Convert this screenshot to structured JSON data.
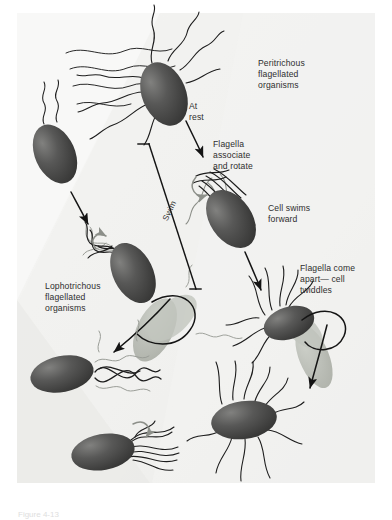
{
  "figure": {
    "domain": "Diagram",
    "caption": "Figure 4-13",
    "width": 392,
    "height": 518
  },
  "colors": {
    "background": "#f4f4f2",
    "background_band_light": "#fbfbfa",
    "background_band_dark": "#ececeb",
    "cell_body_dark": "#3c3c3c",
    "cell_body_highlight": "#6f6f6f",
    "cell_body_ghost": "#b9bcb6",
    "flagella_stroke": "#1d1d1d",
    "flagella_ghost_stroke": "#9a9d97",
    "arrow_black": "#141414",
    "arrow_gray": "#8c8f89",
    "text": "#2e2e2e",
    "caption_text": "#dedede"
  },
  "labels": {
    "peritrichous": "Peritrichous\nflagellated\norganisms",
    "at_rest": "At\nrest",
    "flagella_associate": "Flagella\nassociate\nand rotate",
    "cell_swims": "Cell swims\nforward",
    "flagella_apart": "Flagella come\napart— cell\ntwiddles",
    "lophotrichous": "Lophotrichous\nflagellated\norganisms",
    "swim": "Swim"
  },
  "cells": [
    {
      "id": "peritrichous-at-rest",
      "name": "cell-peritrichous-at-rest",
      "arrangement": "peritrichous",
      "state": "at rest",
      "cx": 164,
      "cy": 94,
      "rx": 22,
      "ry": 33,
      "rotation": -22,
      "shade": "dark",
      "flagella_count": 8
    },
    {
      "id": "peritrichous-bundled",
      "name": "cell-peritrichous-bundled",
      "arrangement": "peritrichous",
      "state": "flagella associated and rotating",
      "cx": 231,
      "cy": 219,
      "rx": 21,
      "ry": 32,
      "rotation": -34,
      "shade": "dark",
      "flagella_count": 6
    },
    {
      "id": "peritrichous-twiddling",
      "name": "cell-peritrichous-twiddling",
      "arrangement": "peritrichous",
      "state": "flagella come apart, cell twiddles",
      "cx": 289,
      "cy": 323,
      "rx": 26,
      "ry": 16,
      "rotation": -18,
      "shade": "dark",
      "flagella_count": 7
    },
    {
      "id": "peritrichous-twiddling-ghost",
      "name": "cell-peritrichous-twiddling-ghost",
      "arrangement": "peritrichous",
      "state": "ghost / tumble path",
      "cx": 314,
      "cy": 357,
      "rx": 15,
      "ry": 33,
      "rotation": -22,
      "shade": "ghost",
      "flagella_count": 0
    },
    {
      "id": "peritrichous-rest-lower",
      "name": "cell-peritrichous-rest-lower",
      "arrangement": "peritrichous",
      "state": "at rest after twiddle",
      "cx": 244,
      "cy": 420,
      "rx": 33,
      "ry": 19,
      "rotation": -8,
      "shade": "dark",
      "flagella_count": 9
    },
    {
      "id": "lophotrichous-upper",
      "name": "cell-lophotrichous-upper",
      "arrangement": "lophotrichous",
      "state": "at rest",
      "cx": 55,
      "cy": 154,
      "rx": 20,
      "ry": 31,
      "rotation": -24,
      "shade": "dark",
      "flagella_count": 2
    },
    {
      "id": "lophotrichous-bundled",
      "name": "cell-lophotrichous-bundled",
      "arrangement": "lophotrichous",
      "state": "flagella associated and rotating",
      "cx": 133,
      "cy": 273,
      "rx": 20,
      "ry": 32,
      "rotation": -26,
      "shade": "dark",
      "flagella_count": 4
    },
    {
      "id": "lophotrichous-swimming",
      "name": "cell-lophotrichous-swimming",
      "arrangement": "lophotrichous",
      "state": "cell swims forward",
      "cx": 62,
      "cy": 374,
      "rx": 32,
      "ry": 18,
      "rotation": -11,
      "shade": "dark",
      "flagella_count": 4
    },
    {
      "id": "lophotrichous-ghost",
      "name": "cell-lophotrichous-ghost",
      "arrangement": "lophotrichous",
      "state": "ghost / tumble path",
      "cx": 155,
      "cy": 330,
      "rx": 18,
      "ry": 34,
      "rotation": 26,
      "shade": "ghost",
      "flagella_count": 2
    },
    {
      "id": "lophotrichous-lower",
      "name": "cell-lophotrichous-lower",
      "arrangement": "lophotrichous",
      "state": "flagella come apart, cell twiddles",
      "cx": 103,
      "cy": 452,
      "rx": 32,
      "ry": 18,
      "rotation": -10,
      "shade": "dark",
      "flagella_count": 6
    }
  ],
  "arrows": [
    {
      "id": "arrow-rest-to-associate",
      "name": "arrow-rest-to-associate",
      "kind": "black",
      "from": [
        186,
        120
      ],
      "to": [
        205,
        155
      ]
    },
    {
      "id": "arrow-swim-to-twiddle",
      "name": "arrow-swim-to-twiddle",
      "kind": "black",
      "from": [
        247,
        250
      ],
      "to": [
        262,
        289
      ]
    },
    {
      "id": "arrow-twiddle-to-rest",
      "name": "arrow-twiddle-to-rest",
      "kind": "black",
      "from": [
        318,
        336
      ],
      "to": [
        305,
        390
      ]
    },
    {
      "id": "arrow-lopho-rest-to-associate",
      "name": "arrow-lopho-rest-to-associate",
      "kind": "black",
      "from": [
        70,
        190
      ],
      "to": [
        86,
        222
      ]
    },
    {
      "id": "arrow-lopho-tumble",
      "name": "arrow-lopho-tumble",
      "kind": "black",
      "from": [
        165,
        300
      ],
      "to": [
        111,
        357
      ]
    },
    {
      "id": "arrow-rotation-upper",
      "name": "arrow-rotation-bundle-upper",
      "kind": "gray-curl",
      "cx": 205,
      "cy": 185
    },
    {
      "id": "arrow-rotation-lopho",
      "name": "arrow-rotation-lophotrichous",
      "kind": "gray-curl",
      "cx": 100,
      "cy": 253
    },
    {
      "id": "arrow-rotation-lower",
      "name": "arrow-rotation-lower-lophotrichous",
      "kind": "gray-curl",
      "cx": 143,
      "cy": 432
    }
  ],
  "bracket": {
    "name": "swim-bracket",
    "label": "Swim",
    "top": [
      138,
      143
    ],
    "bottom": [
      196,
      297
    ]
  }
}
